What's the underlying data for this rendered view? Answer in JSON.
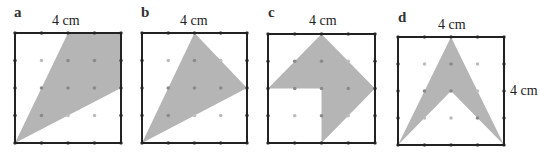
{
  "colors": {
    "fill": "#b5b5b5",
    "border": "#222222",
    "dot_inside": "#8a8a8a",
    "dot_outside": "#bdbdbd",
    "edge_dot": "#555555"
  },
  "grid_units": 4,
  "panels": [
    {
      "letter": "a",
      "top_label": "4 cm",
      "side_label": "",
      "polygon": [
        [
          0,
          0
        ],
        [
          2,
          4
        ],
        [
          4,
          4
        ],
        [
          4,
          2
        ]
      ]
    },
    {
      "letter": "b",
      "top_label": "4 cm",
      "side_label": "",
      "polygon": [
        [
          0,
          0
        ],
        [
          2,
          4
        ],
        [
          4,
          2
        ]
      ]
    },
    {
      "letter": "c",
      "top_label": "4 cm",
      "side_label": "",
      "polygon": [
        [
          0,
          2
        ],
        [
          2,
          4
        ],
        [
          4,
          2
        ],
        [
          2,
          0
        ],
        [
          2,
          2
        ]
      ]
    },
    {
      "letter": "d",
      "top_label": "4 cm",
      "side_label": "4 cm",
      "polygon": [
        [
          0,
          0
        ],
        [
          2,
          4
        ],
        [
          4,
          0
        ],
        [
          2,
          2
        ]
      ]
    }
  ]
}
